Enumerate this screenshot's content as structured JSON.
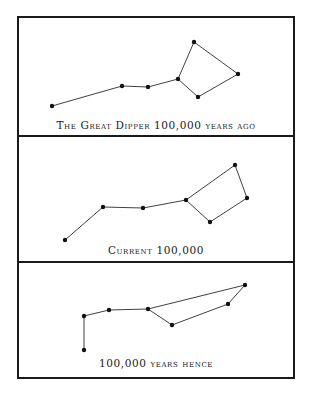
{
  "panels": [
    {
      "caption": "The Great Dipper 100,000 years ago",
      "stars": [
        [
          52,
          106
        ],
        [
          122,
          86
        ],
        [
          148,
          87
        ],
        [
          178,
          79
        ],
        [
          194,
          42
        ],
        [
          238,
          74
        ],
        [
          198,
          97
        ]
      ],
      "edges": [
        [
          0,
          1
        ],
        [
          1,
          2
        ],
        [
          2,
          3
        ],
        [
          3,
          4
        ],
        [
          4,
          5
        ],
        [
          5,
          6
        ],
        [
          6,
          3
        ]
      ]
    },
    {
      "caption": "Current 100,000",
      "stars": [
        [
          65,
          240
        ],
        [
          103,
          207
        ],
        [
          143,
          208
        ],
        [
          186,
          200
        ],
        [
          235,
          165
        ],
        [
          247,
          198
        ],
        [
          210,
          222
        ]
      ],
      "edges": [
        [
          0,
          1
        ],
        [
          1,
          2
        ],
        [
          2,
          3
        ],
        [
          3,
          4
        ],
        [
          4,
          5
        ],
        [
          5,
          6
        ],
        [
          6,
          3
        ]
      ]
    },
    {
      "caption": "100,000 years hence",
      "stars": [
        [
          84,
          350
        ],
        [
          84,
          316
        ],
        [
          109,
          310
        ],
        [
          148,
          309
        ],
        [
          172,
          325
        ],
        [
          228,
          304
        ],
        [
          245,
          285
        ]
      ],
      "edges": [
        [
          0,
          1
        ],
        [
          1,
          2
        ],
        [
          2,
          3
        ],
        [
          3,
          4
        ],
        [
          4,
          5
        ],
        [
          5,
          6
        ],
        [
          6,
          3
        ]
      ]
    }
  ],
  "colors": {
    "ink": "#1a1a1a",
    "background": "#ffffff"
  }
}
